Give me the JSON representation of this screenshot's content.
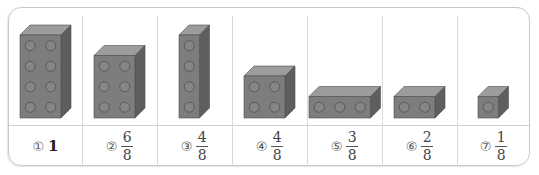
{
  "colors": {
    "front": "#7d7d7d",
    "top": "#9c9c9c",
    "side": "#5e5e5e",
    "stud_fill": "#868686",
    "stud_stroke": "#5a5a5a",
    "border": "#c9c9c9"
  },
  "options": [
    {
      "marker": "①",
      "value_type": "whole",
      "whole": "1",
      "bricks": {
        "cols": 2,
        "rows": 4
      }
    },
    {
      "marker": "②",
      "value_type": "fraction",
      "numerator": "6",
      "denominator": "8",
      "bricks": {
        "cols": 2,
        "rows": 3
      }
    },
    {
      "marker": "③",
      "value_type": "fraction",
      "numerator": "4",
      "denominator": "8",
      "bricks": {
        "cols": 1,
        "rows": 4
      }
    },
    {
      "marker": "④",
      "value_type": "fraction",
      "numerator": "4",
      "denominator": "8",
      "bricks": {
        "cols": 2,
        "rows": 2
      }
    },
    {
      "marker": "⑤",
      "value_type": "fraction",
      "numerator": "3",
      "denominator": "8",
      "bricks": {
        "cols": 3,
        "rows": 1
      }
    },
    {
      "marker": "⑥",
      "value_type": "fraction",
      "numerator": "2",
      "denominator": "8",
      "bricks": {
        "cols": 2,
        "rows": 1
      }
    },
    {
      "marker": "⑦",
      "value_type": "fraction",
      "numerator": "1",
      "denominator": "8",
      "bricks": {
        "cols": 1,
        "rows": 1
      }
    }
  ]
}
